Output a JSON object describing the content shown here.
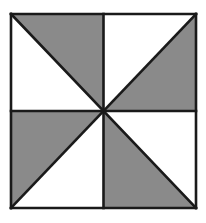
{
  "figure": {
    "type": "pinwheel-square",
    "colors": {
      "background": "#ffffff",
      "shade": "#8a8a8a",
      "stroke": "#1a1a1a"
    },
    "bounds": {
      "x0": 11,
      "y0": 14,
      "x1": 196,
      "y1": 208
    },
    "center": {
      "x": 103.5,
      "y": 111
    },
    "shaded_triangles": [
      {
        "quadrant": "top-left",
        "points": "11,14 103.5,14 103.5,111"
      },
      {
        "quadrant": "top-right",
        "points": "196,14 196,111 103.5,111"
      },
      {
        "quadrant": "bottom-left",
        "points": "11,111 103.5,111 11,208"
      },
      {
        "quadrant": "bottom-right",
        "points": "103.5,111 103.5,208 196,208"
      }
    ]
  }
}
